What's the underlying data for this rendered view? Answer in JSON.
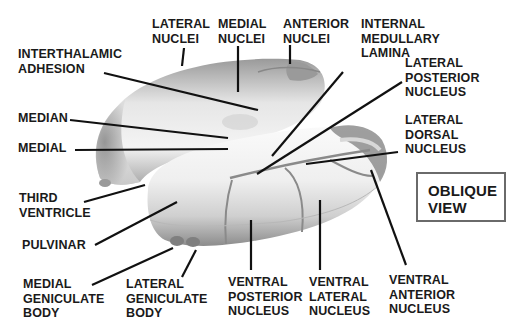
{
  "figure": {
    "view_label": "OBLIQUE\nVIEW"
  },
  "labels": {
    "lateral_nuclei": "LATERAL\nNUCLEI",
    "medial_nuclei": "MEDIAL\nNUCLEI",
    "anterior_nuclei": "ANTERIOR\nNUCLEI",
    "internal_medullary_lamina": "INTERNAL\nMEDULLARY\nLAMINA",
    "interthalamic_adhesion": "INTERTHALAMIC\nADHESION",
    "lateral_posterior_nucleus": "LATERAL\nPOSTERIOR\nNUCLEUS",
    "median": "MEDIAN",
    "medial": "MEDIAL",
    "lateral_dorsal_nucleus": "LATERAL\nDORSAL\nNUCLEUS",
    "third_ventricle": "THIRD\nVENTRICLE",
    "pulvinar": "PULVINAR",
    "medial_geniculate_body": "MEDIAL\nGENICULATE\nBODY",
    "lateral_geniculate_body": "LATERAL\nGENICULATE\nBODY",
    "ventral_posterior_nucleus": "VENTRAL\nPOSTERIOR\nNUCLEUS",
    "ventral_lateral_nucleus": "VENTRAL\nLATERAL\nNUCLEUS",
    "ventral_anterior_nucleus": "VENTRAL\nANTERIOR\nNUCLEUS"
  },
  "colors": {
    "label_text": "#1a1a1a",
    "leader_line": "#111111",
    "structure_light": "#f2f2f2",
    "structure_mid": "#c8c8c8",
    "structure_dark": "#8a8a8a",
    "box_border": "#6a6a6a"
  }
}
